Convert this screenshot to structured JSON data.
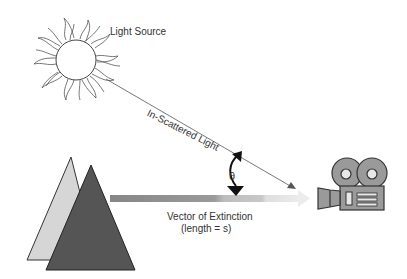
{
  "labels": {
    "light_source": "Light Source",
    "in_scattered": "In-Scattered Light",
    "theta": "θ",
    "vector_title": "Vector of Extinction",
    "vector_length": "(length = s)"
  },
  "elements": {
    "sun": {
      "icon": "sun-icon",
      "center": [
        76,
        60
      ],
      "radius": 20,
      "stroke": "#555555"
    },
    "mountains": {
      "back": {
        "icon": "triangle-back-icon",
        "fill": "#d8d8d8",
        "stroke": "#333333"
      },
      "front": {
        "icon": "triangle-front-icon",
        "fill": "#555555",
        "stroke": "#222222"
      }
    },
    "extinction_vector": {
      "icon": "gradient-arrow-icon",
      "colors": [
        "#8a8a8a",
        "#bdbdbd",
        "#e2e2e2"
      ]
    },
    "scatter_ray": {
      "icon": "ray-arrow-icon",
      "color": "#555555"
    },
    "angle_marker": {
      "icon": "angle-arc-icon",
      "color": "#111111"
    },
    "camera": {
      "icon": "movie-camera-icon",
      "fill": "#9a9a9a",
      "stroke": "#333333"
    }
  }
}
